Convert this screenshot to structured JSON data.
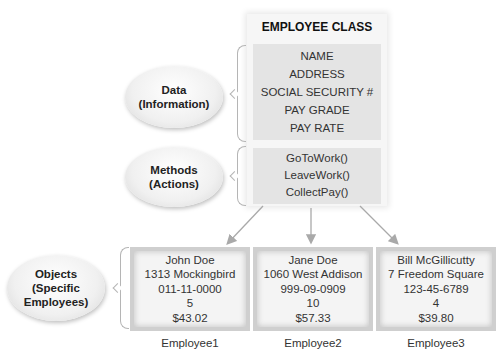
{
  "class": {
    "title": "EMPLOYEE CLASS",
    "attributes": [
      "NAME",
      "ADDRESS",
      "SOCIAL SECURITY #",
      "PAY  GRADE",
      "PAY RATE"
    ],
    "methods": [
      "GoToWork()",
      "LeaveWork()",
      "CollectPay()"
    ]
  },
  "labels": {
    "data": [
      "Data",
      "(Information)"
    ],
    "methods": [
      "Methods",
      "(Actions)"
    ],
    "objects": [
      "Objects",
      "(Specific",
      "Employees)"
    ]
  },
  "objects": [
    {
      "name": "Employee1",
      "fields": [
        "John Doe",
        "1313 Mockingbird",
        "011-11-0000",
        "5",
        "$43.02"
      ]
    },
    {
      "name": "Employee2",
      "fields": [
        "Jane Doe",
        "1060 West Addison",
        "999-09-0909",
        "10",
        "$57.33"
      ]
    },
    {
      "name": "Employee3",
      "fields": [
        "Bill McGillicutty",
        "7 Freedom Square",
        "123-45-6789",
        "4",
        "$39.80"
      ]
    }
  ],
  "colors": {
    "box_fill": "#e4e4e4",
    "object_border": "#cfcfcf",
    "arrow": "#a9a9a9"
  }
}
